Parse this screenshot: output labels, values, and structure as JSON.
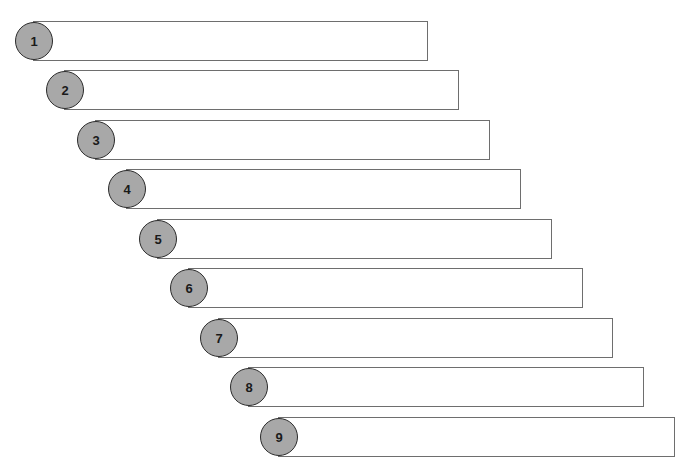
{
  "diagram": {
    "title": "",
    "colors": {
      "circle_fill": "#a8a8a8",
      "circle_border": "#2a2a2a",
      "bar_border": "#6e6e6e",
      "background": "#ffffff"
    },
    "steps": [
      {
        "label": "1",
        "text": "",
        "x": 15,
        "y": 21,
        "bar_right": 428
      },
      {
        "label": "2",
        "text": "",
        "x": 46,
        "y": 70,
        "bar_right": 459
      },
      {
        "label": "3",
        "text": "",
        "x": 77,
        "y": 120,
        "bar_right": 490
      },
      {
        "label": "4",
        "text": "",
        "x": 108,
        "y": 169,
        "bar_right": 521
      },
      {
        "label": "5",
        "text": "",
        "x": 139,
        "y": 219,
        "bar_right": 552
      },
      {
        "label": "6",
        "text": "",
        "x": 170,
        "y": 268,
        "bar_right": 583
      },
      {
        "label": "7",
        "text": "",
        "x": 200,
        "y": 318,
        "bar_right": 613
      },
      {
        "label": "8",
        "text": "",
        "x": 230,
        "y": 367,
        "bar_right": 644
      },
      {
        "label": "9",
        "text": "",
        "x": 260,
        "y": 417,
        "bar_right": 675
      }
    ]
  }
}
